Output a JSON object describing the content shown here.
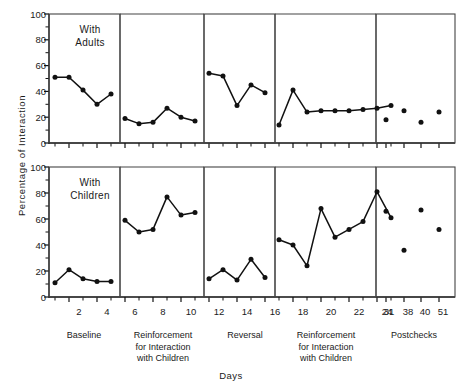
{
  "figure": {
    "ylabel": "Percentage of Interaction",
    "xlabel": "Days",
    "panel_top_note_line1": "With",
    "panel_top_note_line2": "Adults",
    "panel_bottom_note_line1": "With",
    "panel_bottom_note_line2": "Children",
    "line_color": "#111111",
    "box_color": "#444444"
  },
  "y_ticks": [
    "0",
    "20",
    "40",
    "60",
    "80",
    "100"
  ],
  "x_ticks": [
    "2",
    "4",
    "6",
    "8",
    "10",
    "12",
    "14",
    "16",
    "18",
    "20",
    "22",
    "24",
    "31",
    "38",
    "40",
    "51"
  ],
  "phases": [
    {
      "label_lines": [
        "Baseline"
      ]
    },
    {
      "label_lines": [
        "Reinforcement",
        "for Interaction",
        "with Children"
      ]
    },
    {
      "label_lines": [
        "Reversal"
      ]
    },
    {
      "label_lines": [
        "Reinforcement",
        "for Interaction",
        "with Children"
      ]
    },
    {
      "label_lines": [
        "Postchecks"
      ]
    }
  ],
  "chart_data": {
    "type": "line",
    "title": "",
    "xlabel": "Days",
    "ylabel": "Percentage of Interaction",
    "ylim": [
      0,
      100
    ],
    "yticks": [
      0,
      20,
      40,
      60,
      80,
      100
    ],
    "xlim": [
      0.5,
      17.5
    ],
    "grid": false,
    "legend": null,
    "panels": [
      {
        "name": "With Adults",
        "segments": [
          {
            "phase": "Baseline",
            "x": [
              1,
              2,
              3,
              4,
              5
            ],
            "y": [
              51,
              51,
              41,
              30,
              38
            ]
          },
          {
            "phase": "Reinforcement for Interaction with Children",
            "x": [
              6,
              7,
              8,
              9,
              10,
              11
            ],
            "y": [
              19,
              15,
              16,
              27,
              20,
              17
            ]
          },
          {
            "phase": "Reversal",
            "x": [
              12,
              13,
              14,
              15,
              16
            ],
            "y": [
              54,
              52,
              29,
              45,
              39
            ]
          },
          {
            "phase": "Reinforcement for Interaction with Children",
            "x": [
              17,
              18,
              19,
              20,
              21,
              22,
              23,
              24,
              25
            ],
            "y": [
              14,
              41,
              24,
              25,
              25,
              25,
              26,
              27,
              29
            ]
          },
          {
            "phase": "Postchecks",
            "x": [
              31,
              38,
              40,
              51
            ],
            "y": [
              18,
              25,
              16,
              24
            ],
            "markers_only": true
          }
        ]
      },
      {
        "name": "With Children",
        "segments": [
          {
            "phase": "Baseline",
            "x": [
              1,
              2,
              3,
              4,
              5
            ],
            "y": [
              11,
              21,
              14,
              12,
              12
            ]
          },
          {
            "phase": "Reinforcement for Interaction with Children",
            "x": [
              6,
              7,
              8,
              9,
              10,
              11
            ],
            "y": [
              59,
              50,
              52,
              77,
              63,
              65
            ]
          },
          {
            "phase": "Reversal",
            "x": [
              12,
              13,
              14,
              15,
              16
            ],
            "y": [
              14,
              21,
              13,
              29,
              15
            ]
          },
          {
            "phase": "Reinforcement for Interaction with Children",
            "x": [
              17,
              18,
              19,
              20,
              21,
              22,
              23,
              24,
              25
            ],
            "y": [
              44,
              40,
              24,
              68,
              46,
              52,
              58,
              81,
              61
            ]
          },
          {
            "phase": "Postchecks",
            "x": [
              31,
              38,
              40,
              51
            ],
            "y": [
              66,
              36,
              67,
              52
            ],
            "markers_only": true
          }
        ]
      }
    ]
  }
}
